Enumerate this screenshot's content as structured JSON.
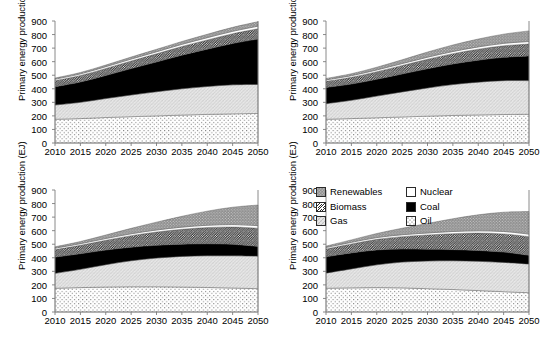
{
  "figure": {
    "axis_title": "Primary energy production (EJ)",
    "y_ticks": [
      "900",
      "800",
      "700",
      "600",
      "500",
      "400",
      "300",
      "200",
      "100",
      "0"
    ],
    "x_ticks": [
      "2010",
      "2015",
      "2020",
      "2025",
      "2030",
      "2035",
      "2040",
      "2045",
      "2050"
    ]
  },
  "legend": {
    "items": [
      {
        "label": "Renewables",
        "pattern": "gray-dots",
        "swatch": "renewables-swatch"
      },
      {
        "label": "Nuclear",
        "pattern": "white",
        "swatch": "nuclear-swatch"
      },
      {
        "label": "Biomass",
        "pattern": "diagonal-hatch",
        "swatch": "biomass-swatch"
      },
      {
        "label": "Coal",
        "pattern": "solid-black",
        "swatch": "coal-swatch"
      },
      {
        "label": "Gas",
        "pattern": "light-crosshatch",
        "swatch": "gas-swatch"
      },
      {
        "label": "Oil",
        "pattern": "fine-dots",
        "swatch": "oil-swatch"
      }
    ]
  },
  "colors": {
    "renewables": "#8c8c8c",
    "nuclear": "#ffffff",
    "biomass": "#ffffff",
    "coal": "#000000",
    "gas": "#e3e3e3",
    "oil": "#ffffff",
    "axis": "#808080",
    "outline": "#555555"
  },
  "chart_data": {
    "type": "area",
    "title": "",
    "xlabel": "",
    "ylabel": "Primary energy production (EJ)",
    "ylim": [
      0,
      900
    ],
    "xlim": [
      2010,
      2050
    ],
    "grid": false,
    "legend_position": "inside-top-left-of-panel-4",
    "stack_order_bottom_to_top": [
      "Oil",
      "Gas",
      "Coal",
      "Biomass",
      "Nuclear",
      "Renewables"
    ],
    "x": [
      2010,
      2015,
      2020,
      2025,
      2030,
      2035,
      2040,
      2045,
      2050
    ],
    "panels": [
      {
        "id": "panel-1",
        "position": "top-left",
        "series": [
          {
            "name": "Oil",
            "values": [
              175,
              180,
              188,
              194,
              200,
              206,
              211,
              215,
              218
            ]
          },
          {
            "name": "Gas",
            "values": [
              105,
              120,
              140,
              160,
              178,
              194,
              206,
              214,
              214
            ]
          },
          {
            "name": "Coal",
            "values": [
              135,
              150,
              170,
              195,
              220,
              248,
              275,
              305,
              335
            ]
          },
          {
            "name": "Biomass",
            "values": [
              45,
              48,
              52,
              56,
              60,
              64,
              68,
              72,
              76
            ]
          },
          {
            "name": "Nuclear",
            "values": [
              11,
              12,
              13,
              14,
              15,
              16,
              17,
              18,
              19
            ]
          },
          {
            "name": "Renewables",
            "values": [
              8,
              10,
              12,
              15,
              18,
              21,
              25,
              29,
              33
            ]
          }
        ],
        "totals": [
          479,
          520,
          575,
          634,
          691,
          749,
          802,
          853,
          895
        ]
      },
      {
        "id": "panel-2",
        "position": "top-right",
        "series": [
          {
            "name": "Oil",
            "values": [
              175,
              180,
              186,
              192,
              198,
              203,
              207,
              210,
              212
            ]
          },
          {
            "name": "Gas",
            "values": [
              115,
              135,
              160,
              185,
              208,
              228,
              242,
              250,
              248
            ]
          },
          {
            "name": "Coal",
            "values": [
              120,
              120,
              124,
              132,
              142,
              152,
              162,
              172,
              182
            ]
          },
          {
            "name": "Biomass",
            "values": [
              45,
              50,
              56,
              63,
              70,
              76,
              81,
              85,
              88
            ]
          },
          {
            "name": "Nuclear",
            "values": [
              11,
              12,
              13,
              14,
              15,
              16,
              17,
              18,
              19
            ]
          },
          {
            "name": "Renewables",
            "values": [
              10,
              14,
              20,
              28,
              38,
              48,
              58,
              68,
              78
            ]
          }
        ],
        "totals": [
          476,
          511,
          559,
          614,
          671,
          723,
          767,
          803,
          827
        ]
      },
      {
        "id": "panel-3",
        "position": "bottom-left",
        "series": [
          {
            "name": "Oil",
            "values": [
              175,
              180,
              184,
              186,
              186,
              184,
              181,
              177,
              172
            ]
          },
          {
            "name": "Gas",
            "values": [
              110,
              135,
              165,
              192,
              212,
              226,
              234,
              238,
              240
            ]
          },
          {
            "name": "Coal",
            "values": [
              120,
              115,
              108,
              100,
              94,
              90,
              88,
              84,
              72
            ]
          },
          {
            "name": "Biomass",
            "values": [
              55,
              62,
              72,
              85,
              98,
              110,
              120,
              128,
              134
            ]
          },
          {
            "name": "Nuclear",
            "values": [
              11,
              12,
              13,
              14,
              15,
              16,
              17,
              18,
              19
            ]
          },
          {
            "name": "Renewables",
            "values": [
              10,
              16,
              26,
              40,
              58,
              80,
              104,
              128,
              152
            ]
          }
        ],
        "totals": [
          481,
          520,
          568,
          617,
          663,
          706,
          744,
          773,
          789
        ]
      },
      {
        "id": "panel-4",
        "position": "bottom-right",
        "series": [
          {
            "name": "Oil",
            "values": [
              175,
              178,
              180,
              178,
              172,
              166,
              158,
              150,
              142
            ]
          },
          {
            "name": "Gas",
            "values": [
              112,
              140,
              168,
              190,
              204,
              212,
              216,
              216,
              212
            ]
          },
          {
            "name": "Coal",
            "values": [
              120,
              118,
              110,
              96,
              86,
              82,
              80,
              76,
              64
            ]
          },
          {
            "name": "Biomass",
            "values": [
              58,
              66,
              78,
              92,
              106,
              118,
              128,
              134,
              138
            ]
          },
          {
            "name": "Nuclear",
            "values": [
              11,
              12,
              13,
              14,
              15,
              16,
              17,
              18,
              19
            ]
          },
          {
            "name": "Renewables",
            "values": [
              10,
              18,
              30,
              48,
              70,
              94,
              118,
              142,
              166
            ]
          }
        ],
        "totals": [
          486,
          532,
          579,
          618,
          653,
          688,
          717,
          736,
          741
        ]
      }
    ]
  }
}
